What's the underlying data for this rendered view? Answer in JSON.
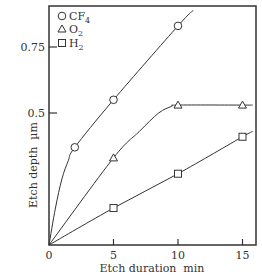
{
  "chart_data": {
    "type": "line",
    "title": "",
    "xlabel": "Etch duration  min",
    "ylabel": "Etch depth  µm",
    "xlim": [
      0,
      16
    ],
    "ylim": [
      0,
      0.9
    ],
    "x_ticks": [
      0,
      5,
      10,
      15
    ],
    "x_tick_labels": [
      "0",
      "5",
      "10",
      "15"
    ],
    "y_ticks": [
      0.5,
      0.75
    ],
    "y_tick_labels": [
      "0.5",
      "0.75"
    ],
    "grid": false,
    "legend_position": "upper-left",
    "series": [
      {
        "name": "CF4",
        "label_main": "CF",
        "label_sub": "4",
        "marker": "circle",
        "x": [
          2,
          5,
          10
        ],
        "y": [
          0.37,
          0.55,
          0.83
        ],
        "curve": [
          [
            0,
            0
          ],
          [
            0.5,
            0.14
          ],
          [
            1,
            0.25
          ],
          [
            1.5,
            0.32
          ],
          [
            2,
            0.37
          ],
          [
            5,
            0.55
          ],
          [
            10,
            0.83
          ],
          [
            11.2,
            0.89
          ]
        ]
      },
      {
        "name": "O2",
        "label_main": "O",
        "label_sub": "2",
        "marker": "triangle",
        "x": [
          5,
          10,
          15
        ],
        "y": [
          0.33,
          0.53,
          0.53
        ],
        "curve": [
          [
            0,
            0
          ],
          [
            5,
            0.33
          ],
          [
            7,
            0.43
          ],
          [
            8.5,
            0.5
          ],
          [
            9.5,
            0.525
          ],
          [
            10,
            0.53
          ],
          [
            15,
            0.53
          ],
          [
            15.8,
            0.53
          ]
        ]
      },
      {
        "name": "H2",
        "label_main": "H",
        "label_sub": "2",
        "marker": "square",
        "x": [
          5,
          10,
          15
        ],
        "y": [
          0.14,
          0.27,
          0.41
        ],
        "curve": [
          [
            0,
            0
          ],
          [
            5,
            0.14
          ],
          [
            10,
            0.27
          ],
          [
            15,
            0.41
          ],
          [
            15.8,
            0.43
          ]
        ]
      }
    ]
  },
  "layout": {
    "plot": {
      "left": 49,
      "top": 6,
      "right": 256,
      "bottom": 245
    },
    "x_px_per_unit": 12.9,
    "y_px_per_unit": 264
  }
}
